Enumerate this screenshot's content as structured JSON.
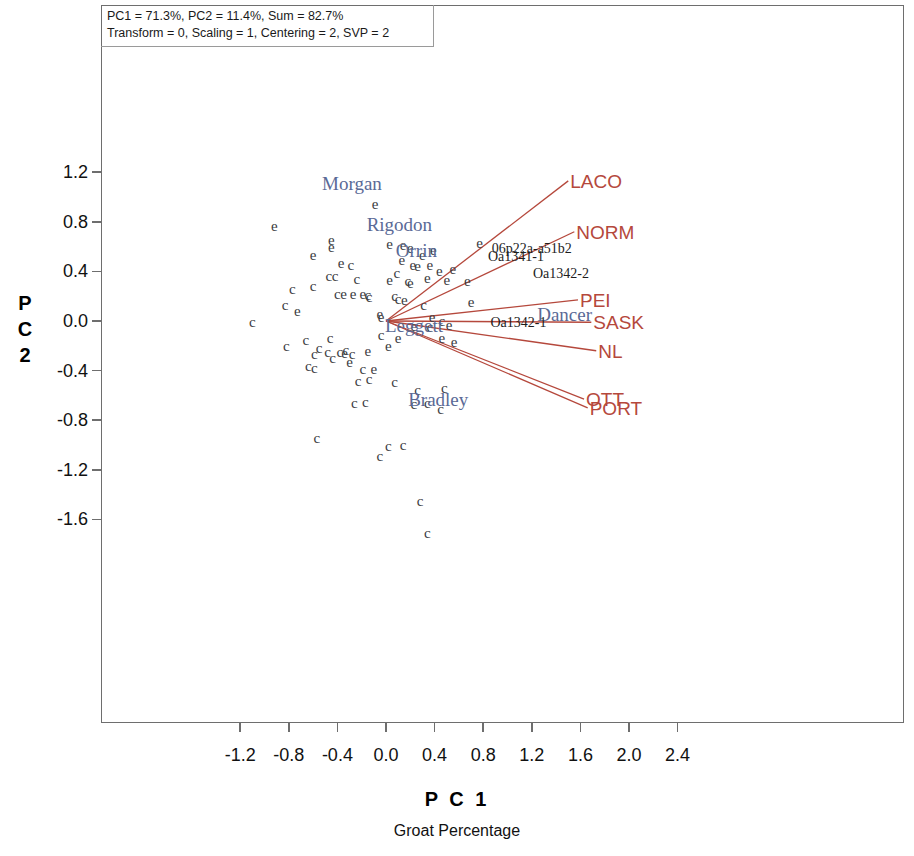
{
  "annotation": {
    "line1": "PC1 = 71.3%, PC2 = 11.4%, Sum = 82.7%",
    "line2": "Transform = 0, Scaling = 1, Centering = 2, SVP = 2"
  },
  "colors": {
    "vector": "#b5483c",
    "genotype_label": "#5a6a96",
    "point": "#3b3b41",
    "sample_label": "#1d1d1d",
    "frame": "#6e6e6e"
  },
  "chart_data": {
    "type": "scatter",
    "title": "",
    "subtitle": "Groat Percentage",
    "xlabel": "P C 1",
    "ylabel": "P C 2",
    "grid": false,
    "legend": "none",
    "xlim": [
      -1.45,
      2.6
    ],
    "ylim": [
      -1.92,
      1.4
    ],
    "xticks": [
      -1.2,
      -0.8,
      -0.4,
      0.0,
      0.4,
      0.8,
      1.2,
      1.6,
      2.0,
      2.4
    ],
    "xticklabels": [
      "-1.2",
      "-0.8",
      "-0.4",
      "0.0",
      "0.4",
      "0.8",
      "1.2",
      "1.6",
      "2.0",
      "2.4"
    ],
    "yticks": [
      1.2,
      0.8,
      0.4,
      0.0,
      -0.4,
      -0.8,
      -1.2,
      -1.6
    ],
    "yticklabels": [
      "1.2",
      "0.8",
      "0.4",
      "0.0",
      "-0.4",
      "-0.8",
      "-1.2",
      "-1.6"
    ],
    "variance_explained": {
      "PC1": 71.3,
      "PC2": 11.4,
      "sum": 82.7
    },
    "biplot_settings": {
      "transform": 0,
      "scaling": 1,
      "centering": 2,
      "svp": 2
    },
    "vectors_origin": [
      0.0,
      0.0
    ],
    "vectors": [
      {
        "label": "LACO",
        "x": 1.5,
        "y": 1.13
      },
      {
        "label": "NORM",
        "x": 1.55,
        "y": 0.72
      },
      {
        "label": "PEI",
        "x": 1.58,
        "y": 0.17
      },
      {
        "label": "SASK",
        "x": 1.69,
        "y": -0.01
      },
      {
        "label": "NL",
        "x": 1.73,
        "y": -0.24
      },
      {
        "label": "OTT",
        "x": 1.63,
        "y": -0.63
      },
      {
        "label": "PORT",
        "x": 1.66,
        "y": -0.7
      }
    ],
    "genotype_labels": [
      {
        "label": "Morgan",
        "x": -0.28,
        "y": 1.11
      },
      {
        "label": "Rigodon",
        "x": 0.11,
        "y": 0.78
      },
      {
        "label": "Orrin",
        "x": 0.25,
        "y": 0.57
      },
      {
        "label": "Leggett",
        "x": 0.23,
        "y": -0.03
      },
      {
        "label": "Dancer",
        "x": 1.47,
        "y": 0.06
      },
      {
        "label": "Bradley",
        "x": 0.43,
        "y": -0.63
      }
    ],
    "sample_labels": [
      {
        "label": "06p22a-a51b2",
        "x": 1.2,
        "y": 0.58
      },
      {
        "label": "Oa1341-1",
        "x": 1.07,
        "y": 0.52
      },
      {
        "label": "Oa1342-2",
        "x": 1.44,
        "y": 0.38
      },
      {
        "label": "Oa1342-1",
        "x": 1.09,
        "y": -0.02
      }
    ],
    "point_glyphs": [
      "c",
      "e"
    ],
    "points": [
      {
        "g": "e",
        "x": -0.92,
        "y": 0.77
      },
      {
        "g": "e",
        "x": -0.09,
        "y": 0.94
      },
      {
        "g": "e",
        "x": -0.45,
        "y": 0.65
      },
      {
        "g": "e",
        "x": -0.45,
        "y": 0.6
      },
      {
        "g": "e",
        "x": -0.6,
        "y": 0.53
      },
      {
        "g": "e",
        "x": -0.37,
        "y": 0.47
      },
      {
        "g": "c",
        "x": -0.29,
        "y": 0.45
      },
      {
        "g": "c",
        "x": -0.47,
        "y": 0.36
      },
      {
        "g": "c",
        "x": -0.42,
        "y": 0.36
      },
      {
        "g": "c",
        "x": -0.24,
        "y": 0.34
      },
      {
        "g": "c",
        "x": -0.77,
        "y": 0.26
      },
      {
        "g": "c",
        "x": -0.6,
        "y": 0.28
      },
      {
        "g": "c",
        "x": -0.4,
        "y": 0.22
      },
      {
        "g": "e",
        "x": -0.35,
        "y": 0.22
      },
      {
        "g": "e",
        "x": -0.27,
        "y": 0.22
      },
      {
        "g": "e",
        "x": -0.19,
        "y": 0.22
      },
      {
        "g": "c",
        "x": -0.15,
        "y": 0.21
      },
      {
        "g": "c",
        "x": -0.14,
        "y": 0.19
      },
      {
        "g": "c",
        "x": -0.83,
        "y": 0.13
      },
      {
        "g": "e",
        "x": -0.73,
        "y": 0.08
      },
      {
        "g": "e",
        "x": -0.05,
        "y": 0.06
      },
      {
        "g": "e",
        "x": -0.04,
        "y": 0.03
      },
      {
        "g": "c",
        "x": -1.1,
        "y": -0.01
      },
      {
        "g": "e",
        "x": 0.03,
        "y": 0.62
      },
      {
        "g": "e",
        "x": 0.14,
        "y": 0.61
      },
      {
        "g": "e",
        "x": 0.2,
        "y": 0.59
      },
      {
        "g": "e",
        "x": 0.39,
        "y": 0.57
      },
      {
        "g": "e",
        "x": 0.3,
        "y": 0.53
      },
      {
        "g": "e",
        "x": 0.13,
        "y": 0.49
      },
      {
        "g": "e",
        "x": 0.22,
        "y": 0.45
      },
      {
        "g": "e",
        "x": 0.26,
        "y": 0.44
      },
      {
        "g": "e",
        "x": 0.36,
        "y": 0.45
      },
      {
        "g": "c",
        "x": 0.09,
        "y": 0.39
      },
      {
        "g": "e",
        "x": 0.44,
        "y": 0.4
      },
      {
        "g": "e",
        "x": 0.55,
        "y": 0.42
      },
      {
        "g": "e",
        "x": 0.03,
        "y": 0.33
      },
      {
        "g": "c",
        "x": 0.18,
        "y": 0.32
      },
      {
        "g": "e",
        "x": 0.2,
        "y": 0.31
      },
      {
        "g": "e",
        "x": 0.34,
        "y": 0.35
      },
      {
        "g": "e",
        "x": 0.5,
        "y": 0.33
      },
      {
        "g": "e",
        "x": 0.77,
        "y": 0.63
      },
      {
        "g": "e",
        "x": 0.67,
        "y": 0.32
      },
      {
        "g": "c",
        "x": 0.07,
        "y": 0.2
      },
      {
        "g": "c",
        "x": 0.1,
        "y": 0.18
      },
      {
        "g": "e",
        "x": 0.15,
        "y": 0.17
      },
      {
        "g": "c",
        "x": 0.31,
        "y": 0.13
      },
      {
        "g": "e",
        "x": 0.7,
        "y": 0.15
      },
      {
        "g": "e",
        "x": 0.38,
        "y": 0.03
      },
      {
        "g": "c",
        "x": 0.46,
        "y": 0.0
      },
      {
        "g": "e",
        "x": 0.23,
        "y": -0.04
      },
      {
        "g": "c",
        "x": 0.36,
        "y": -0.05
      },
      {
        "g": "e",
        "x": 0.52,
        "y": -0.03
      },
      {
        "g": "c",
        "x": -0.04,
        "y": -0.11
      },
      {
        "g": "e",
        "x": 0.1,
        "y": -0.14
      },
      {
        "g": "e",
        "x": 0.46,
        "y": -0.14
      },
      {
        "g": "e",
        "x": 0.56,
        "y": -0.17
      },
      {
        "g": "e",
        "x": 0.02,
        "y": -0.2
      },
      {
        "g": "e",
        "x": -0.15,
        "y": -0.24
      },
      {
        "g": "c",
        "x": -0.66,
        "y": -0.15
      },
      {
        "g": "c",
        "x": -0.46,
        "y": -0.14
      },
      {
        "g": "c",
        "x": -0.82,
        "y": -0.2
      },
      {
        "g": "c",
        "x": -0.55,
        "y": -0.22
      },
      {
        "g": "c",
        "x": -0.48,
        "y": -0.25
      },
      {
        "g": "c",
        "x": -0.59,
        "y": -0.27
      },
      {
        "g": "c",
        "x": -0.33,
        "y": -0.23
      },
      {
        "g": "c",
        "x": -0.38,
        "y": -0.25
      },
      {
        "g": "e",
        "x": -0.34,
        "y": -0.26
      },
      {
        "g": "c",
        "x": -0.28,
        "y": -0.27
      },
      {
        "g": "c",
        "x": -0.44,
        "y": -0.3
      },
      {
        "g": "e",
        "x": -0.3,
        "y": -0.33
      },
      {
        "g": "c",
        "x": -0.64,
        "y": -0.36
      },
      {
        "g": "c",
        "x": -0.59,
        "y": -0.38
      },
      {
        "g": "c",
        "x": -0.19,
        "y": -0.39
      },
      {
        "g": "e",
        "x": -0.1,
        "y": -0.39
      },
      {
        "g": "c",
        "x": -0.23,
        "y": -0.48
      },
      {
        "g": "c",
        "x": -0.14,
        "y": -0.47
      },
      {
        "g": "c",
        "x": 0.07,
        "y": -0.49
      },
      {
        "g": "c",
        "x": 0.26,
        "y": -0.56
      },
      {
        "g": "c",
        "x": 0.48,
        "y": -0.54
      },
      {
        "g": "c",
        "x": -0.26,
        "y": -0.66
      },
      {
        "g": "c",
        "x": -0.17,
        "y": -0.65
      },
      {
        "g": "c",
        "x": 0.23,
        "y": -0.67
      },
      {
        "g": "c",
        "x": 0.34,
        "y": -0.66
      },
      {
        "g": "c",
        "x": 0.45,
        "y": -0.71
      },
      {
        "g": "c",
        "x": -0.57,
        "y": -0.94
      },
      {
        "g": "c",
        "x": 0.02,
        "y": -1.01
      },
      {
        "g": "c",
        "x": 0.14,
        "y": -1.0
      },
      {
        "g": "c",
        "x": -0.05,
        "y": -1.09
      },
      {
        "g": "c",
        "x": 0.28,
        "y": -1.45
      },
      {
        "g": "c",
        "x": 0.34,
        "y": -1.71
      }
    ]
  }
}
